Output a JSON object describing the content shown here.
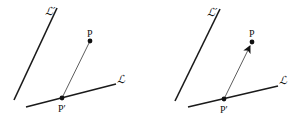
{
  "panels": [
    {
      "id": "left",
      "description": "Point P projected onto line L at P', with segment P'P (no arrow)",
      "labels": {
        "line_L": "ℒ",
        "line_L_prime": "ℒ′",
        "point_P": "P",
        "point_P_prime": "P′"
      },
      "arrow": false
    },
    {
      "id": "right",
      "description": "Same configuration with vector arrow from P' to P",
      "labels": {
        "line_L": "ℒ",
        "line_L_prime": "ℒ′",
        "point_P": "P",
        "point_P_prime": "P′"
      },
      "arrow": true
    }
  ],
  "colors": {
    "ink": "#111111",
    "background": "#ffffff"
  }
}
